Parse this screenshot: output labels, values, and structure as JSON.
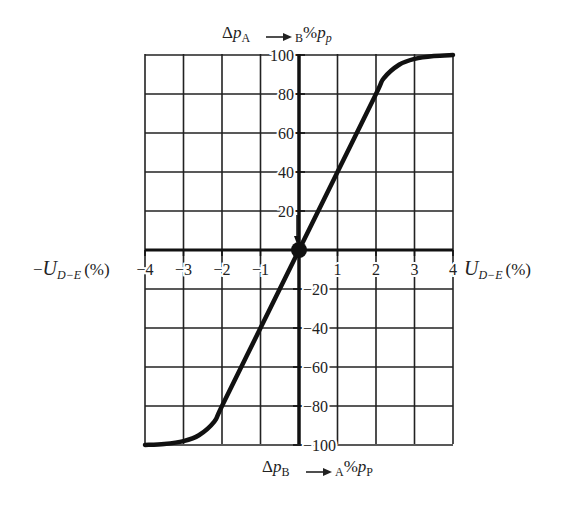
{
  "chart_data": {
    "type": "line",
    "title": "",
    "xlabel_right": "U_{D-E} (%)",
    "xlabel_left": "-U_{D-E} (%)",
    "ylabel_top": "Δp_A → B %p_p",
    "ylabel_bottom": "Δp_B → A %p_P",
    "xlim": [
      -4,
      4
    ],
    "ylim": [
      -100,
      100
    ],
    "x_ticks": [
      -4,
      -3,
      -2,
      -1,
      1,
      2,
      3,
      4
    ],
    "y_ticks": [
      100,
      80,
      60,
      40,
      20,
      -20,
      -40,
      -60,
      -80,
      -100
    ],
    "grid": true,
    "series": [
      {
        "name": "pressure gain characteristic",
        "x": [
          -4,
          -3.5,
          -3,
          -2.6,
          -2.2,
          -2,
          -1,
          0,
          1,
          2,
          2.2,
          2.6,
          3,
          3.5,
          4
        ],
        "y": [
          -100,
          -99.5,
          -98,
          -95,
          -88,
          -80,
          -40,
          0,
          40,
          80,
          88,
          95,
          98,
          99.5,
          100
        ]
      }
    ],
    "annotations": [
      "origin point marker",
      "arrow pointing down to origin along vertical axis"
    ]
  },
  "labels": {
    "top_axis": {
      "delta": "Δ",
      "p": "p",
      "sub_a": "A",
      "arrow": "→",
      "sub_b": "B",
      "pct": "%",
      "p2": "p",
      "sub_p": "p"
    },
    "bottom_axis": {
      "delta": "Δ",
      "p": "p",
      "sub_b": "B",
      "arrow": "→",
      "sub_a": "A",
      "pct": "%",
      "p2": "p",
      "sub_p": "P"
    },
    "right_axis": {
      "u": "U",
      "sub": "D−E",
      "unit": "(%)"
    },
    "left_axis": {
      "minus": "−",
      "u": "U",
      "sub": "D−E",
      "unit": "(%)"
    }
  },
  "ticks": {
    "x": [
      "−4",
      "−3",
      "−2",
      "−1",
      "1",
      "2",
      "3",
      "4"
    ],
    "y_pos": [
      "100",
      "80",
      "60",
      "40",
      "20"
    ],
    "y_neg": [
      "−20",
      "−40",
      "−60",
      "−80",
      "−100"
    ]
  }
}
